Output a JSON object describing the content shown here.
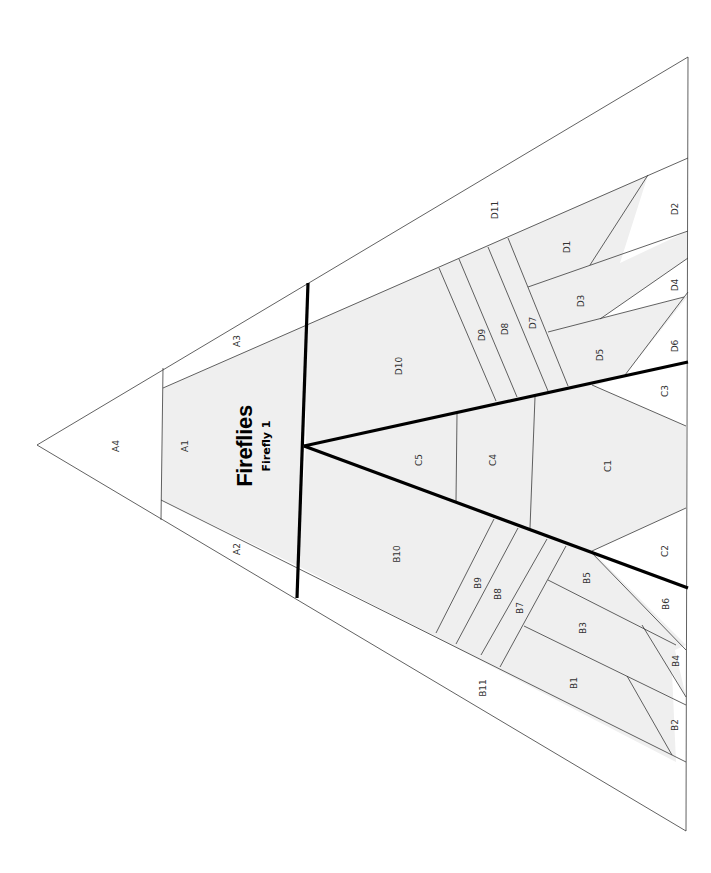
{
  "pattern": {
    "title": "Fireflies",
    "subtitle": "Firefly 1",
    "shade_color": "#efefef",
    "line_color": "#3a3a3a",
    "seam_color": "#000000"
  },
  "sections": {
    "A": [
      "A1",
      "A2",
      "A3",
      "A4"
    ],
    "B": [
      "B1",
      "B2",
      "B3",
      "B4",
      "B5",
      "B6",
      "B7",
      "B8",
      "B9",
      "B10",
      "B11"
    ],
    "C": [
      "C1",
      "C2",
      "C3",
      "C4",
      "C5"
    ],
    "D": [
      "D1",
      "D2",
      "D3",
      "D4",
      "D5",
      "D6",
      "D7",
      "D8",
      "D9",
      "D10",
      "D11"
    ]
  },
  "labels": {
    "A1": "A1",
    "A2": "A2",
    "A3": "A3",
    "A4": "A4",
    "B1": "B1",
    "B2": "B2",
    "B3": "B3",
    "B4": "B4",
    "B5": "B5",
    "B6": "B6",
    "B7": "B7",
    "B8": "B8",
    "B9": "B9",
    "B10": "B10",
    "B11": "B11",
    "C1": "C1",
    "C2": "C2",
    "C3": "C3",
    "C4": "C4",
    "C5": "C5",
    "D1": "D1",
    "D2": "D2",
    "D3": "D3",
    "D4": "D4",
    "D5": "D5",
    "D6": "D6",
    "D7": "D7",
    "D8": "D8",
    "D9": "D9",
    "D10": "D10",
    "D11": "D11"
  }
}
